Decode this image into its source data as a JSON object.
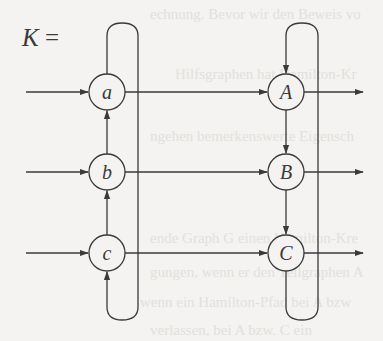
{
  "equation": {
    "lhs": "K",
    "equals": "="
  },
  "nodes": {
    "left": [
      {
        "id": "a",
        "label": "a",
        "x": 107,
        "y": 92
      },
      {
        "id": "b",
        "label": "b",
        "x": 107,
        "y": 172
      },
      {
        "id": "c",
        "label": "c",
        "x": 107,
        "y": 253
      }
    ],
    "right": [
      {
        "id": "A",
        "label": "A",
        "x": 286,
        "y": 92
      },
      {
        "id": "B",
        "label": "B",
        "x": 286,
        "y": 172
      },
      {
        "id": "C",
        "label": "C",
        "x": 286,
        "y": 253
      }
    ]
  },
  "edges": [
    {
      "from": "input",
      "to": "a"
    },
    {
      "from": "input",
      "to": "b"
    },
    {
      "from": "input",
      "to": "c"
    },
    {
      "from": "a",
      "to": "A"
    },
    {
      "from": "b",
      "to": "B"
    },
    {
      "from": "c",
      "to": "C"
    },
    {
      "from": "A",
      "to": "output"
    },
    {
      "from": "B",
      "to": "output"
    },
    {
      "from": "C",
      "to": "output"
    },
    {
      "from": "b",
      "to": "a"
    },
    {
      "from": "c",
      "to": "b"
    },
    {
      "from": "a",
      "to": "c",
      "via": "loop"
    },
    {
      "from": "A",
      "to": "B"
    },
    {
      "from": "B",
      "to": "C"
    },
    {
      "from": "C",
      "to": "A",
      "via": "loop"
    }
  ],
  "colors": {
    "stroke": "#3a3a3a",
    "background": "#f4f3f1",
    "bleed_through": "#e2e0dc"
  }
}
